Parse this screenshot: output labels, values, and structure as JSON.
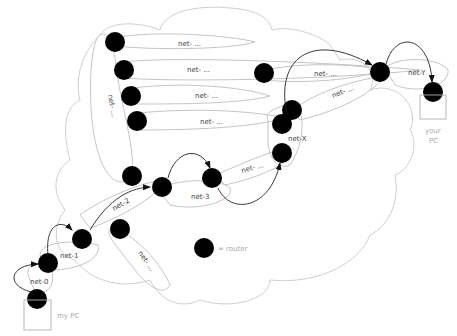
{
  "diagram": {
    "cloud_label": "Internet",
    "networks": [
      {
        "id": "net-top1",
        "label": "net- ..."
      },
      {
        "id": "net-top2",
        "label": "net- ..."
      },
      {
        "id": "net-top3",
        "label": "net- ..."
      },
      {
        "id": "net-top4",
        "label": "net- ..."
      },
      {
        "id": "net-vert",
        "label": "net- ..."
      },
      {
        "id": "net-0",
        "label": "net-0"
      },
      {
        "id": "net-1",
        "label": "net-1"
      },
      {
        "id": "net-2",
        "label": "net-2"
      },
      {
        "id": "net-3",
        "label": "net-3"
      },
      {
        "id": "net-mid",
        "label": "net- ..."
      },
      {
        "id": "net-low",
        "label": "net- ..."
      },
      {
        "id": "net-x",
        "label": "net-X"
      },
      {
        "id": "net-r1",
        "label": "net- ..."
      },
      {
        "id": "net-r2",
        "label": "net- ..."
      },
      {
        "id": "net-y",
        "label": "net-Y"
      }
    ],
    "endpoints": {
      "source": "my PC",
      "destination_line1": "your",
      "destination_line2": "PC"
    },
    "legend": {
      "symbol": "router-icon",
      "text": "= router"
    }
  }
}
